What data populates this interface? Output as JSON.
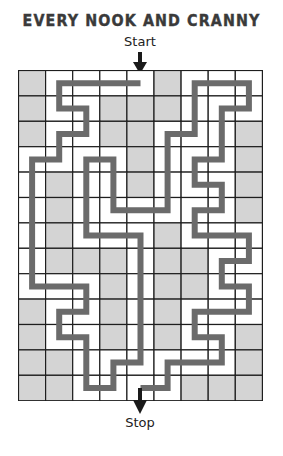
{
  "puzzle": {
    "title": "EVERY NOOK AND CRANNY",
    "start_label": "Start",
    "stop_label": "Stop"
  },
  "grid": {
    "columns": 9,
    "rows": 13,
    "colors": {
      "shaded_cell": "#d4d4d4",
      "empty_cell": "#ffffff",
      "grid_line": "#1e1e1e",
      "path": "#6b6b6b",
      "arrow": "#1a1a1a"
    },
    "shaded_cells": [
      [
        0,
        0
      ],
      [
        5,
        0
      ],
      [
        0,
        1
      ],
      [
        3,
        1
      ],
      [
        4,
        1
      ],
      [
        5,
        1
      ],
      [
        0,
        2
      ],
      [
        3,
        2
      ],
      [
        4,
        2
      ],
      [
        8,
        2
      ],
      [
        4,
        3
      ],
      [
        8,
        3
      ],
      [
        1,
        4
      ],
      [
        4,
        4
      ],
      [
        8,
        4
      ],
      [
        1,
        5
      ],
      [
        8,
        5
      ],
      [
        1,
        6
      ],
      [
        5,
        6
      ],
      [
        1,
        7
      ],
      [
        2,
        7
      ],
      [
        3,
        7
      ],
      [
        5,
        7
      ],
      [
        6,
        7
      ],
      [
        3,
        8
      ],
      [
        5,
        8
      ],
      [
        6,
        8
      ],
      [
        0,
        9
      ],
      [
        3,
        9
      ],
      [
        5,
        9
      ],
      [
        0,
        10
      ],
      [
        3,
        10
      ],
      [
        5,
        10
      ],
      [
        8,
        10
      ],
      [
        0,
        11
      ],
      [
        1,
        11
      ],
      [
        8,
        11
      ],
      [
        0,
        12
      ],
      [
        1,
        12
      ],
      [
        6,
        12
      ],
      [
        7,
        12
      ],
      [
        8,
        12
      ]
    ],
    "start_cell": [
      4,
      0
    ],
    "stop_cell": [
      4,
      12
    ]
  },
  "path": {
    "description": "Solution route through cell centers, as [col,row] waypoints",
    "waypoints": [
      [
        4,
        0
      ],
      [
        1,
        0
      ],
      [
        1,
        1
      ],
      [
        2,
        1
      ],
      [
        2,
        2
      ],
      [
        1,
        2
      ],
      [
        1,
        3
      ],
      [
        0,
        3
      ],
      [
        0,
        8
      ],
      [
        2,
        8
      ],
      [
        2,
        9
      ],
      [
        1,
        9
      ],
      [
        1,
        10
      ],
      [
        2,
        10
      ],
      [
        2,
        12
      ],
      [
        3,
        12
      ],
      [
        3,
        11
      ],
      [
        4,
        11
      ],
      [
        4,
        6
      ],
      [
        2,
        6
      ],
      [
        2,
        3
      ],
      [
        3,
        3
      ],
      [
        3,
        5
      ],
      [
        5,
        5
      ],
      [
        5,
        2
      ],
      [
        6,
        2
      ],
      [
        6,
        0
      ],
      [
        8,
        0
      ],
      [
        8,
        1
      ],
      [
        7,
        1
      ],
      [
        7,
        3
      ],
      [
        6,
        3
      ],
      [
        6,
        4
      ],
      [
        7,
        4
      ],
      [
        7,
        5
      ],
      [
        6,
        5
      ],
      [
        6,
        6
      ],
      [
        8,
        6
      ],
      [
        8,
        7
      ],
      [
        7,
        7
      ],
      [
        7,
        8
      ],
      [
        8,
        8
      ],
      [
        8,
        9
      ],
      [
        6,
        9
      ],
      [
        6,
        10
      ],
      [
        7,
        10
      ],
      [
        7,
        11
      ],
      [
        5,
        11
      ],
      [
        5,
        12
      ],
      [
        4,
        12
      ]
    ]
  }
}
